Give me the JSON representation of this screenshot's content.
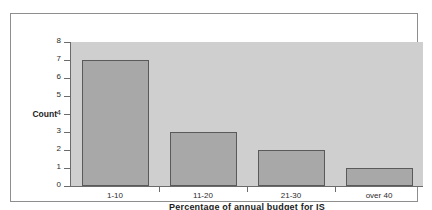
{
  "chart_data": {
    "type": "bar",
    "title": "",
    "subtitle": "",
    "xlabel": "Percentage of annual budget for IS",
    "ylabel": "Count",
    "categories": [
      "1-10",
      "11-20",
      "21-30",
      "over 40"
    ],
    "values": [
      7,
      3,
      2,
      1
    ],
    "ylim": [
      0,
      8
    ],
    "ytick_labels": [
      "8",
      "7",
      "6",
      "5",
      "4",
      "3",
      "2",
      "1",
      "0"
    ],
    "ytick_values": [
      8,
      7,
      6,
      5,
      4,
      3,
      2,
      1,
      0
    ],
    "grid": false,
    "legend": false,
    "legend_position": "none",
    "colors": {
      "bar_fill": "#a8a8a8",
      "bar_edge": "#5a5a5a",
      "plot_background": "#cfcfcf",
      "figure_background": "#ffffff",
      "axis_line": "#6b6b6b",
      "frame_border": "#8e8e8e",
      "text": "#1c1c1c"
    }
  }
}
